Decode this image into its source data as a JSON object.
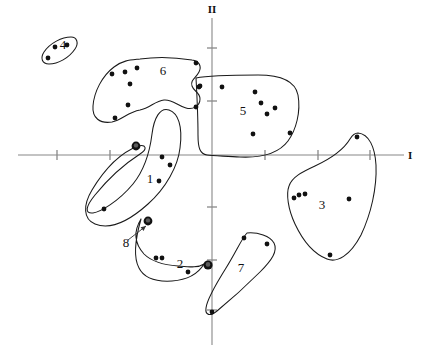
{
  "chart_data": {
    "type": "scatter",
    "title": "",
    "subtitle": "",
    "xlabel": "I",
    "ylabel": "II",
    "grid": false,
    "legend": "none",
    "axes": {
      "horizontal_axis_label": "I",
      "vertical_axis_label": "II",
      "origin_px": [
        212,
        155
      ],
      "x_tick_px": [
        57,
        110,
        265,
        318,
        370
      ],
      "y_tick_px": [
        48,
        101,
        207,
        260,
        310
      ],
      "xlim_px": [
        18,
        404
      ],
      "ylim_px": [
        18,
        345
      ],
      "tick_labels": []
    },
    "clusters": [
      {
        "id": "1",
        "label": "1",
        "label_px": [
          150,
          183
        ],
        "n_points": 4,
        "points": [
          [
            162,
            157
          ],
          [
            170,
            165
          ],
          [
            159,
            181
          ],
          [
            104,
            209
          ]
        ],
        "outline": "M138,146 C120,153 104,170 92,190 C83,205 83,219 95,224 C110,230 128,222 148,204 C166,188 178,166 180,148 C183,126 178,113 169,110 C160,107 154,118 152,134 C150,150 146,168 133,184 C118,202 100,212 93,213 C84,214 86,206 95,195 C108,179 126,163 140,154 C148,149 146,144 138,146 Z"
      },
      {
        "id": "2",
        "label": "2",
        "label_px": [
          180,
          268
        ],
        "n_points": 3,
        "points": [
          [
            156,
            258
          ],
          [
            162,
            258
          ],
          [
            188,
            272
          ]
        ],
        "outline": "M141,219 C133,232 135,244 144,254 C152,262 164,265 178,266 C190,267 198,268 204,264 C198,274 186,280 172,281 C156,282 144,278 139,268 C133,257 135,240 141,219 Z"
      },
      {
        "id": "3",
        "label": "3",
        "label_px": [
          322,
          209
        ],
        "n_points": 6,
        "points": [
          [
            357,
            137
          ],
          [
            294,
            198
          ],
          [
            299,
            195
          ],
          [
            305,
            194
          ],
          [
            349,
            199
          ],
          [
            330,
            255
          ]
        ],
        "outline": "M358,133 C369,134 375,147 376,165 C377,188 371,214 361,235 C350,256 337,263 327,259 C314,254 303,241 295,224 C288,209 286,194 289,186 C292,177 302,172 315,166 C330,159 344,149 350,139 C353,134 355,133 358,133 Z"
      },
      {
        "id": "4",
        "label": "4",
        "label_px": [
          63,
          49
        ],
        "n_points": 3,
        "points": [
          [
            48,
            58
          ],
          [
            55,
            47
          ],
          [
            67,
            45
          ]
        ],
        "outline": "M71,37 C77,37 79,43 75,49 C69,58 58,64 49,64 C42,64 40,58 44,52 C50,43 62,37 71,37 Z"
      },
      {
        "id": "5",
        "label": "5",
        "label_px": [
          243,
          115
        ],
        "n_points": 8,
        "points": [
          [
            200,
            86
          ],
          [
            222,
            87
          ],
          [
            255,
            92
          ],
          [
            261,
            103
          ],
          [
            267,
            114
          ],
          [
            275,
            108
          ],
          [
            253,
            134
          ],
          [
            290,
            133
          ]
        ],
        "outline": "M196,78 C210,75 235,75 258,75 C280,75 295,80 298,95 C301,112 296,130 288,141 C279,153 262,158 240,157 C225,156 212,156 207,155 C200,154 198,148 198,135 C198,118 197,96 196,78 Z"
      },
      {
        "id": "6",
        "label": "6",
        "label_px": [
          163,
          75
        ],
        "n_points": 9,
        "points": [
          [
            112,
            74
          ],
          [
            125,
            72
          ],
          [
            137,
            68
          ],
          [
            130,
            84
          ],
          [
            196,
            63
          ],
          [
            199,
            87
          ],
          [
            128,
            105
          ],
          [
            196,
            107
          ],
          [
            115,
            118
          ]
        ],
        "outline": "M140,59 C160,56 180,58 192,60 C199,61 202,66 199,72 C196,78 190,80 192,86 C194,92 200,92 200,99 C200,106 193,110 186,108 C178,106 172,99 164,100 C155,101 150,108 140,110 C128,112 122,120 112,122 C100,124 92,118 93,106 C94,92 102,76 114,67 C123,60 131,60 140,59 Z"
      },
      {
        "id": "7",
        "label": "7",
        "label_px": [
          241,
          272
        ],
        "n_points": 3,
        "points": [
          [
            244,
            238
          ],
          [
            267,
            244
          ],
          [
            212,
            312
          ]
        ],
        "outline": "M247,233 C258,232 270,236 274,243 C278,251 272,260 260,272 C246,286 228,302 217,311 C210,317 205,315 206,308 C207,299 216,284 226,268 C236,252 242,238 247,233 Z"
      },
      {
        "id": "8",
        "label": "8",
        "label_px": [
          126,
          247
        ],
        "n_points": 0,
        "points": [],
        "outline": ""
      }
    ],
    "ring_markers": [
      {
        "name": "node-top",
        "px": [
          136,
          146
        ],
        "r_outer": 4.4,
        "r_inner": 2.2
      },
      {
        "name": "node-mid",
        "px": [
          148,
          221
        ],
        "r_outer": 4.4,
        "r_inner": 2.2
      },
      {
        "name": "node-bottom",
        "px": [
          208,
          265
        ],
        "r_outer": 4.6,
        "r_inner": 2.3
      }
    ],
    "callout": {
      "name": "label-8-arrow",
      "label": "8",
      "label_px": [
        126,
        247
      ],
      "from_px": [
        128,
        240
      ],
      "to_px": [
        146,
        226
      ]
    },
    "point_radius_px": 2.4,
    "colors": {
      "background": "#ffffff",
      "outline": "#1a1a1a",
      "axis": "#888888",
      "point": "#111111",
      "text": "#111111"
    }
  }
}
